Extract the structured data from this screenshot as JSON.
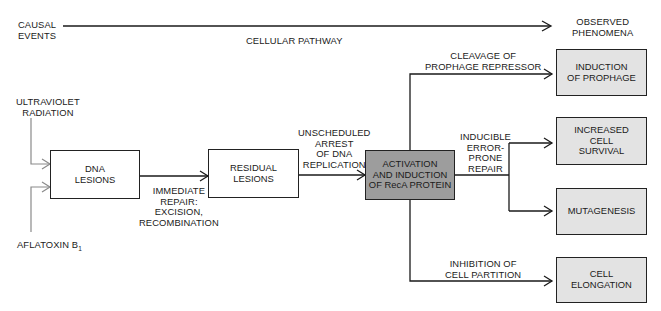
{
  "header": {
    "left_label": "CAUSAL\nEVENTS",
    "center_label": "CELLULAR PATHWAY",
    "right_label": "OBSERVED\nPHENOMENA"
  },
  "causes": [
    {
      "id": "uv",
      "label": "ULTRAVIOLET\nRADIATION"
    },
    {
      "id": "aflatoxin",
      "label": "AFLATOXIN B",
      "subscript": "1"
    }
  ],
  "nodes": {
    "dna_lesions": "DNA\nLESIONS",
    "residual_lesions": "RESIDUAL\nLESIONS",
    "reca": "ACTIVATION\nAND INDUCTION\nOF RecA PROTEIN",
    "prophage": "INDUCTION\nOF PROPHAGE",
    "survival": "INCREASED\nCELL\nSURVIVAL",
    "mutagenesis": "MUTAGENESIS",
    "elongation": "CELL\nELONGATION"
  },
  "edges": {
    "immediate_repair": "IMMEDIATE\nREPAIR:\nEXCISION,\nRECOMBINATION",
    "arrest": "UNSCHEDULED\nARREST\nOF DNA\nREPLICATION",
    "cleavage": "CLEAVAGE OF\nPROPHAGE REPRESSOR",
    "error_prone": "INDUCIBLE\nERROR-\nPRONE\nREPAIR",
    "inhibition": "INHIBITION OF\nCELL PARTITION"
  },
  "colors": {
    "line": "#1a1a1a",
    "cause_line": "#8a8a8a",
    "reca_fill": "#9d9d9d",
    "outcome_fill": "#e3e3e3",
    "box_fill": "#ffffff"
  }
}
